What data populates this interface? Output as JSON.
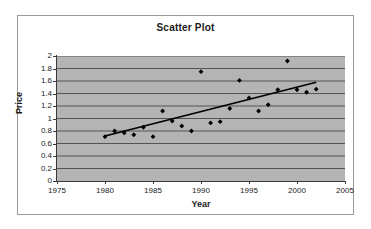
{
  "chart_data": {
    "type": "scatter",
    "title": "Scatter Plot",
    "xlabel": "Year",
    "ylabel": "Price",
    "xlim": [
      1975,
      2005
    ],
    "ylim": [
      0,
      2
    ],
    "xticks": [
      1975,
      1980,
      1985,
      1990,
      1995,
      2000,
      2005
    ],
    "yticks": [
      "0",
      "0.2",
      "0.4",
      "0.6",
      "0.8",
      "1",
      "1.2",
      "1.4",
      "1.6",
      "1.8",
      "2"
    ],
    "grid": "horizontal",
    "legend": "none",
    "plot_background": "#b4b4b4",
    "marker_color": "#000000",
    "trendline_color": "#000000",
    "series": [
      {
        "name": "Price",
        "marker": "diamond",
        "points": [
          {
            "x": 1980,
            "y": 0.71
          },
          {
            "x": 1981,
            "y": 0.8
          },
          {
            "x": 1982,
            "y": 0.77
          },
          {
            "x": 1983,
            "y": 0.74
          },
          {
            "x": 1984,
            "y": 0.86
          },
          {
            "x": 1985,
            "y": 0.71
          },
          {
            "x": 1986,
            "y": 1.12
          },
          {
            "x": 1987,
            "y": 0.96
          },
          {
            "x": 1988,
            "y": 0.88
          },
          {
            "x": 1989,
            "y": 0.8
          },
          {
            "x": 1990,
            "y": 1.75
          },
          {
            "x": 1991,
            "y": 0.93
          },
          {
            "x": 1992,
            "y": 0.95
          },
          {
            "x": 1993,
            "y": 1.16
          },
          {
            "x": 1994,
            "y": 1.61
          },
          {
            "x": 1995,
            "y": 1.33
          },
          {
            "x": 1996,
            "y": 1.12
          },
          {
            "x": 1997,
            "y": 1.22
          },
          {
            "x": 1998,
            "y": 1.46
          },
          {
            "x": 1999,
            "y": 1.92
          },
          {
            "x": 2000,
            "y": 1.46
          },
          {
            "x": 2001,
            "y": 1.42
          },
          {
            "x": 2002,
            "y": 1.47
          }
        ]
      }
    ],
    "trendline": {
      "name": "linear-trend",
      "x_start": 1980,
      "y_start": 0.72,
      "x_end": 2002,
      "y_end": 1.58
    }
  }
}
